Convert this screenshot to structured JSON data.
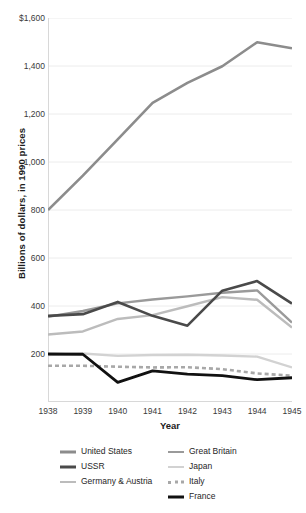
{
  "chart_data": {
    "type": "line",
    "title": "",
    "xlabel": "Year",
    "ylabel": "Billions of dollars, in 1990 prices",
    "x": [
      1938,
      1939,
      1940,
      1941,
      1942,
      1943,
      1944,
      1945
    ],
    "categories": [
      "1938",
      "1939",
      "1940",
      "1941",
      "1942",
      "1943",
      "1944",
      "1945"
    ],
    "ylim": [
      0,
      1600
    ],
    "yticks": [
      200,
      400,
      600,
      800,
      1000,
      1200,
      1400,
      1600
    ],
    "ytick_labels": [
      "200",
      "400",
      "600",
      "800",
      "1,000",
      "1,200",
      "1,400",
      "$1,600"
    ],
    "grid": true,
    "legend_position": "bottom",
    "series": [
      {
        "name": "United States",
        "color": "#8c8c8c",
        "width": 2.6,
        "dash": "none",
        "values": [
          800,
          943,
          1094,
          1246,
          1330,
          1399,
          1499,
          1474
        ]
      },
      {
        "name": "Great Britain",
        "color": "#9a9a9a",
        "width": 2.4,
        "dash": "none",
        "values": [
          355,
          379,
          411,
          427,
          440,
          455,
          465,
          331
        ]
      },
      {
        "name": "USSR",
        "color": "#4a4a4a",
        "width": 2.6,
        "dash": "none",
        "values": [
          359,
          366,
          417,
          359,
          318,
          464,
          504,
          410
        ]
      },
      {
        "name": "Japan",
        "color": "#d2d2d2",
        "width": 2.4,
        "dash": "none",
        "values": [
          196,
          202,
          192,
          196,
          197,
          194,
          189,
          144
        ]
      },
      {
        "name": "Germany & Austria",
        "color": "#bcbcbc",
        "width": 2.4,
        "dash": "none",
        "values": [
          281,
          294,
          346,
          362,
          399,
          437,
          426,
          310
        ]
      },
      {
        "name": "Italy",
        "color": "#a8a8a8",
        "width": 2.6,
        "dash": "4,3",
        "values": [
          151,
          151,
          147,
          144,
          145,
          137,
          119,
          110
        ]
      },
      {
        "name": "France",
        "color": "#111111",
        "width": 2.8,
        "dash": "none",
        "values": [
          200,
          199,
          82,
          130,
          116,
          110,
          93,
          101
        ]
      }
    ]
  },
  "legend": {
    "columns": [
      [
        "United States",
        "USSR",
        "Germany & Austria"
      ],
      [
        "Great Britain",
        "Japan",
        "Italy",
        "France"
      ]
    ]
  }
}
